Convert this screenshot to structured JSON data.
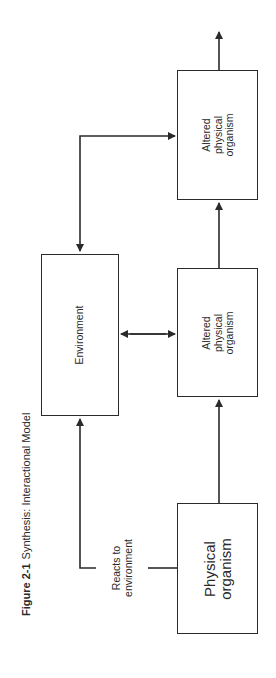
{
  "figure": {
    "number": "Figure 2-1",
    "title": "Synthesis: Interactional Model"
  },
  "nodes": {
    "environment": {
      "label": "Environment"
    },
    "physical_organism": {
      "lines": [
        "Physical",
        "organism"
      ]
    },
    "altered_organism_1": {
      "lines": [
        "Altered",
        "physical",
        "organism"
      ]
    },
    "altered_organism_2": {
      "lines": [
        "Altered",
        "physical",
        "organism"
      ]
    }
  },
  "edges": {
    "reacts_to_environment": {
      "lines": [
        "Reacts to",
        "environment"
      ]
    }
  },
  "colors": {
    "stroke": "#2a2a2a",
    "background": "#ffffff"
  }
}
